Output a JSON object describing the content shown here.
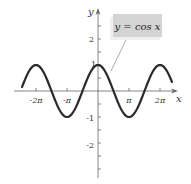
{
  "diagram": {
    "function_label": "y = cos x",
    "x_axis_label": "x",
    "y_axis_label": "y",
    "x_ticks": [
      "-2π",
      "-π",
      "π",
      "2π"
    ],
    "y_ticks": [
      "2",
      "1",
      "-1",
      "-2"
    ],
    "colors": {
      "curve": "#2b2b2b",
      "axis": "#555555",
      "label_box": "#d4d4d4",
      "label_shadow": "#eeeeee"
    }
  }
}
